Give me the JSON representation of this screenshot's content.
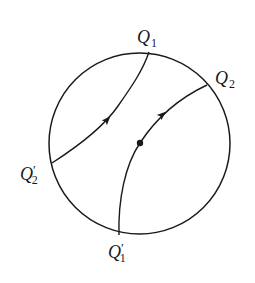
{
  "diagram": {
    "circle": {
      "cx": 139.5,
      "cy": 143.5,
      "r": 90.5,
      "stroke": "#1a1a1a"
    },
    "curves": [
      {
        "name": "curve-q2prime-to-q1",
        "d": "M 52 163 C 80 145, 105 125, 118 106 C 132 86, 143 70, 149 52"
      },
      {
        "name": "curve-q1prime-to-q2",
        "d": "M 119 235 C 118 200, 125 165, 140 143 C 155 120, 175 100, 207 85"
      }
    ],
    "arrows": [
      {
        "name": "arrow-on-left-curve",
        "x": 107,
        "y": 120,
        "angle": -47
      },
      {
        "name": "arrow-on-right-curve",
        "x": 162,
        "y": 115,
        "angle": -42
      }
    ],
    "point": {
      "x": 140,
      "y": 143,
      "r": 3.2
    },
    "labels": [
      {
        "name": "label-q1",
        "main": "Q",
        "sub": "1",
        "prime": "",
        "x": 137,
        "y": 43
      },
      {
        "name": "label-q2",
        "main": "Q",
        "sub": "2",
        "prime": "",
        "x": 215,
        "y": 84
      },
      {
        "name": "label-q2-prime",
        "main": "Q",
        "sub": "2",
        "prime": "′",
        "x": 20,
        "y": 180
      },
      {
        "name": "label-q1-prime",
        "main": "Q",
        "sub": "1",
        "prime": "′",
        "x": 108,
        "y": 258
      }
    ]
  }
}
